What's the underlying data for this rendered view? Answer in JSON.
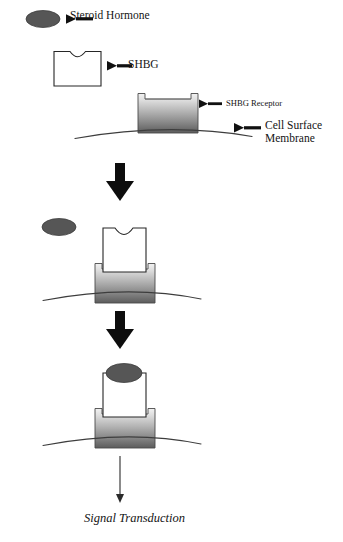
{
  "figure": {
    "background_color": "#ffffff"
  },
  "labels": {
    "steroid_hormone": "Steroid Hormone",
    "shbg": "SHBG",
    "shbg_receptor": "SHBG Receptor",
    "cell_surface_membrane": "Cell Surface\nMembrane",
    "signal_transduction": "Signal Transduction"
  },
  "colors": {
    "ink": "#141414",
    "hormone_fill": "#565656",
    "hormone_stroke": "#3a3a3a",
    "receptor_top": "#efefef",
    "receptor_bottom": "#5e5e5e",
    "receptor_stroke": "#4a4a4a",
    "shbg_fill": "#ffffff",
    "shbg_stroke": "#2a2a2a",
    "membrane_stroke": "#3d3d3d",
    "arrow_bold": "#0d0d0d",
    "arrow_thin": "#2b2b2b"
  },
  "icons": {
    "steroid_hormone": "ellipse-shape",
    "shbg": "notched-box-shape",
    "shbg_receptor": "gradient-cup-shape",
    "cell_membrane": "arc-curve",
    "stage_arrow": "bold-down-arrow",
    "pointer_arrow": "left-pointing-arrow",
    "signal_arrow": "thin-down-arrow"
  },
  "stages": [
    {
      "name": "stage-1-legend",
      "caption": "Unbound steroid hormone, free SHBG, and membrane-bound SHBG receptor",
      "hormone_bound": false,
      "shbg_docked": false
    },
    {
      "name": "stage-2-shbg-docked",
      "caption": "SHBG binds the SHBG receptor at the cell surface membrane",
      "hormone_bound": false,
      "shbg_docked": true
    },
    {
      "name": "stage-3-hormone-bound",
      "caption": "Steroid hormone binds the docked SHBG complex",
      "hormone_bound": true,
      "shbg_docked": true
    }
  ]
}
